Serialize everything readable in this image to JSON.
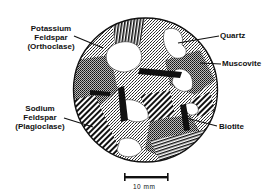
{
  "figure": {
    "type": "thin-section diagram of granite",
    "labels": [
      {
        "id": "potassium-feldspar",
        "lines": [
          "Potassium",
          "Feldspar",
          "(Orthoclase)"
        ]
      },
      {
        "id": "quartz",
        "lines": [
          "Quartz"
        ]
      },
      {
        "id": "muscovite",
        "lines": [
          "Muscovite"
        ]
      },
      {
        "id": "sodium-feldspar",
        "lines": [
          "Sodium",
          "Feldspar",
          "(Plagioclase)"
        ]
      },
      {
        "id": "biotite",
        "lines": [
          "Biotite"
        ]
      }
    ],
    "scale_bar": {
      "label": "10 mm"
    }
  }
}
